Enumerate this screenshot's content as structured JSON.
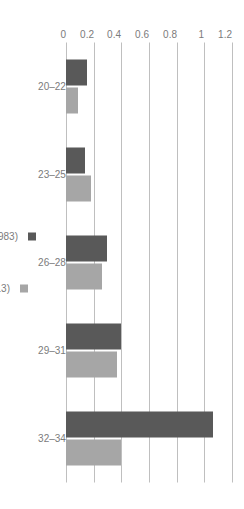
{
  "chart_data": {
    "type": "bar",
    "title": "",
    "subtitle": "",
    "xlabel": "",
    "ylabel": "",
    "orientation": "vertical-rotated",
    "grid": true,
    "legend_position": "bottom",
    "categories": [
      "20–22",
      "23–25",
      "26–28",
      "29–31",
      "32–34"
    ],
    "ylim": [
      0,
      1.2
    ],
    "yticks": [
      0,
      0.2,
      0.4,
      0.6,
      0.8,
      1,
      1.2
    ],
    "ytick_labels": [
      "0",
      "0.2",
      "0.4",
      "0.6",
      "0.8",
      "1",
      "1.2"
    ],
    "series": [
      {
        "name": "Late Boomers (in 1983)",
        "color": "#595959",
        "values": [
          0.15,
          0.14,
          0.3,
          0.4,
          1.06
        ]
      },
      {
        "name": "Millennials (in 2013)",
        "color": "#a6a6a6",
        "values": [
          0.09,
          0.18,
          0.26,
          0.37,
          0.4
        ]
      }
    ]
  },
  "legend": {
    "items": [
      {
        "label": "Late Boomers (in 1983)",
        "color": "#595959",
        "marker": "square-marker"
      },
      {
        "label": "Millennials (in 2013)",
        "color": "#a6a6a6",
        "marker": "square-marker"
      }
    ]
  },
  "axis": {
    "value_ticks": [
      "1.2",
      "1",
      "0.8",
      "0.6",
      "0.4",
      "0.2",
      "0"
    ],
    "category_ticks": [
      "20–22",
      "23–25",
      "26–28",
      "29–31",
      "32–34"
    ]
  },
  "colors": {
    "gridline": "#bfbfbf",
    "text": "#7b7b7b",
    "background": "#ffffff",
    "series_dark": "#595959",
    "series_light": "#a6a6a6"
  }
}
